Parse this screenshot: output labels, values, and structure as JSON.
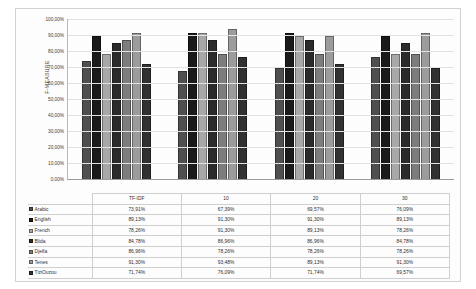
{
  "chart_data": {
    "type": "bar",
    "title": "",
    "xlabel": "",
    "ylabel": "F-MEASURE",
    "categories": [
      "TF-IDF",
      "10",
      "20",
      "30"
    ],
    "ylim": [
      0,
      100
    ],
    "ytick_labels": [
      "0,00%",
      "10,00%",
      "20,00%",
      "30,00%",
      "40,00%",
      "50,00%",
      "60,00%",
      "70,00%",
      "80,00%",
      "90,00%",
      "100,00%"
    ],
    "ytick_values": [
      0,
      10,
      20,
      30,
      40,
      50,
      60,
      70,
      80,
      90,
      100
    ],
    "grid": true,
    "legend_position": "table-left",
    "series": [
      {
        "name": "Arabic",
        "color": "#4f4f4f",
        "values": [
          73.91,
          67.39,
          69.57,
          76.09
        ],
        "labels": [
          "73,91%",
          "67,39%",
          "69,57%",
          "76,09%"
        ]
      },
      {
        "name": "English",
        "color": "#1a1a1a",
        "values": [
          89.13,
          91.3,
          91.3,
          89.13
        ],
        "labels": [
          "89,13%",
          "91,30%",
          "91,30%",
          "89,13%"
        ]
      },
      {
        "name": "French",
        "color": "#a8a8a8",
        "values": [
          78.26,
          91.3,
          89.13,
          78.26
        ],
        "labels": [
          "78,26%",
          "91,30%",
          "89,13%",
          "78,26%"
        ]
      },
      {
        "name": "Blida",
        "color": "#2b2b2b",
        "values": [
          84.78,
          86.96,
          86.96,
          84.78
        ],
        "labels": [
          "84,78%",
          "86,96%",
          "86,96%",
          "84,78%"
        ]
      },
      {
        "name": "Djelfa",
        "color": "#7d7d7d",
        "values": [
          86.96,
          78.26,
          78.26,
          78.26
        ],
        "labels": [
          "86,96%",
          "78,26%",
          "78,26%",
          "78,26%"
        ]
      },
      {
        "name": "Tenes",
        "color": "#9c9c9c",
        "values": [
          91.3,
          93.48,
          89.13,
          91.3
        ],
        "labels": [
          "91,30%",
          "93,48%",
          "89,13%",
          "91,30%"
        ]
      },
      {
        "name": "TiziOuzou",
        "color": "#313131",
        "values": [
          71.74,
          76.09,
          71.74,
          69.57
        ],
        "labels": [
          "71,74%",
          "76,09%",
          "71,74%",
          "69,57%"
        ]
      }
    ]
  }
}
